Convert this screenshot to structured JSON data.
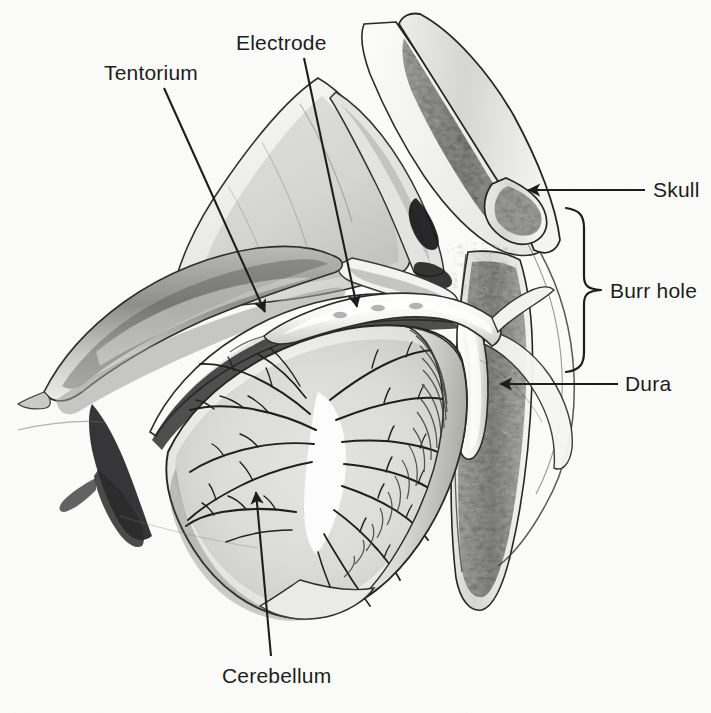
{
  "figure": {
    "kind": "anatomical-illustration",
    "view": "sagittal cutaway section",
    "medium": "grayscale pen-and-ink / airbrush halftone drawing on paper",
    "background_color": "#fcfcfb",
    "ink_color": "#1d1d1d"
  },
  "labels": {
    "tentorium": "Tentorium",
    "electrode": "Electrode",
    "skull": "Skull",
    "burr_hole": "Burr hole",
    "dura": "Dura",
    "cerebellum": "Cerebellum"
  },
  "leaders": [
    {
      "name": "tentorium",
      "style": "arrow",
      "from": [
        164,
        88
      ],
      "to": [
        265,
        312
      ]
    },
    {
      "name": "electrode",
      "style": "arrow",
      "from": [
        304,
        58
      ],
      "to": [
        357,
        307
      ]
    },
    {
      "name": "skull",
      "style": "arrow",
      "from": [
        645,
        190
      ],
      "to": [
        528,
        190
      ]
    },
    {
      "name": "burr_hole",
      "style": "brace",
      "from": [
        600,
        290
      ],
      "to": [
        575,
        290
      ]
    },
    {
      "name": "dura",
      "style": "arrow",
      "from": [
        618,
        384
      ],
      "to": [
        500,
        384
      ]
    },
    {
      "name": "cerebellum",
      "style": "arrow",
      "from": [
        271,
        656
      ],
      "to": [
        256,
        492
      ]
    }
  ],
  "brace": {
    "name": "burr-hole-brace",
    "top": 208,
    "bottom": 365,
    "spine_x": 585,
    "tip_x": 601,
    "tip_y": 290
  },
  "structures": [
    {
      "name": "skull",
      "description": "Occipital bone cut edge showing outer table, diploe with cancellous trabecular bone, and inner table"
    },
    {
      "name": "burr-hole",
      "description": "Circular opening trephined through the occipital bone, bridged by a retracted flap of skin and soft tissue"
    },
    {
      "name": "dura",
      "description": "Dura mater reflected at the margin of the burr hole, covering the cerebellar surface"
    },
    {
      "name": "tentorium",
      "description": "Tentorium cerebelli, the dural shelf separating the occipital lobe above from the cerebellum below"
    },
    {
      "name": "cerebellum",
      "description": "Cerebellum in midsagittal cut, displaying the arbor vitae branching white matter and the cortical folia"
    },
    {
      "name": "electrode",
      "description": "Flat strip electrode passed through the burr hole and slid beneath the tentorium onto the cerebellar surface"
    },
    {
      "name": "occipital-lobe",
      "description": "Undersurface of the occipital lobe resting on the tentorium"
    },
    {
      "name": "venous-sinus",
      "description": "Dark transverse/straight venous sinus at the tentorial attachment"
    },
    {
      "name": "brainstem-medulla",
      "description": "Brainstem shading at the lower left of the posterior fossa"
    }
  ]
}
